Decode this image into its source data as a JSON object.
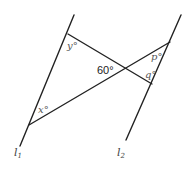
{
  "diagram": {
    "lines": {
      "l1": {
        "label": "l",
        "subscript": "1"
      },
      "l2": {
        "label": "l",
        "subscript": "2"
      }
    },
    "angles": {
      "y": "y°",
      "x": "x°",
      "p": "p°",
      "q": "q°",
      "center": "60°"
    }
  }
}
